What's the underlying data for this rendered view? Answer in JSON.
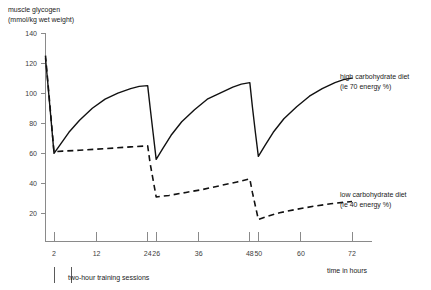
{
  "chart_data": {
    "type": "line",
    "title": "",
    "ylabel_line1": "muscle glycogen",
    "ylabel_line2": "(mmol/kg wet weight)",
    "xlabel": "time in hours",
    "xlim": [
      0,
      72
    ],
    "ylim": [
      0,
      140
    ],
    "grid": false,
    "legend_position": "inline-right",
    "xticks": [
      2,
      12,
      24,
      26,
      36,
      48,
      50,
      60,
      72
    ],
    "xticklabels": [
      "2",
      "12",
      "24",
      "26",
      "36",
      "48",
      "50",
      "60",
      "72"
    ],
    "yticks": [
      20,
      40,
      60,
      80,
      100,
      120,
      140
    ],
    "yticklabels": [
      "20",
      "40",
      "60",
      "80",
      "100",
      "120",
      "140"
    ],
    "annotations": [
      {
        "name": "high-carb-label",
        "line1": "high carbohydrate diet",
        "line2": "(ie 70 energy %)",
        "x": 72,
        "y": 112
      },
      {
        "name": "low-carb-label",
        "line1": "low carbohydrate diet",
        "line2": "(ie 40 energy %)",
        "x": 72,
        "y": 36
      },
      {
        "name": "training-sessions-note",
        "line1": "two-hour training sessions",
        "line2": "",
        "x": 2,
        "y": -22
      }
    ],
    "training_sessions": [
      {
        "label": "session-marker-1",
        "x": 2
      },
      {
        "label": "session-marker-2",
        "x": 6
      }
    ],
    "series": [
      {
        "name": "high carbohydrate diet (ie 70 energy %)",
        "style": "solid",
        "points": [
          [
            0,
            123
          ],
          [
            0.5,
            108
          ],
          [
            1.0,
            92
          ],
          [
            1.5,
            76
          ],
          [
            2.0,
            60
          ],
          [
            3.5,
            66
          ],
          [
            5.5,
            74
          ],
          [
            8,
            82
          ],
          [
            11,
            90
          ],
          [
            14,
            96
          ],
          [
            17,
            100
          ],
          [
            20,
            103
          ],
          [
            22,
            104.5
          ],
          [
            24,
            105
          ],
          [
            24.6,
            90
          ],
          [
            25.3,
            73
          ],
          [
            26,
            56
          ],
          [
            27.5,
            63
          ],
          [
            29.5,
            72
          ],
          [
            32,
            81
          ],
          [
            35,
            89
          ],
          [
            38,
            96
          ],
          [
            41,
            100
          ],
          [
            44,
            104
          ],
          [
            46,
            106
          ],
          [
            48,
            107
          ],
          [
            48.6,
            91
          ],
          [
            49.3,
            74
          ],
          [
            50,
            58
          ],
          [
            51.5,
            65
          ],
          [
            53.5,
            74
          ],
          [
            56,
            83
          ],
          [
            59,
            91
          ],
          [
            62,
            98
          ],
          [
            65,
            103
          ],
          [
            68,
            107
          ],
          [
            70,
            109
          ],
          [
            72,
            110
          ]
        ]
      },
      {
        "name": "low carbohydrate diet (ie 40 energy %)",
        "style": "dashed",
        "points": [
          [
            0,
            125
          ],
          [
            0.5,
            109
          ],
          [
            1.0,
            93
          ],
          [
            1.5,
            77
          ],
          [
            2.0,
            61
          ],
          [
            4,
            61.5
          ],
          [
            8,
            62
          ],
          [
            12,
            62.8
          ],
          [
            16,
            63.5
          ],
          [
            20,
            64.3
          ],
          [
            24,
            65
          ],
          [
            24.6,
            53
          ],
          [
            25.3,
            42
          ],
          [
            26,
            31
          ],
          [
            29,
            32
          ],
          [
            33,
            34
          ],
          [
            37,
            36
          ],
          [
            41,
            38.5
          ],
          [
            45,
            41
          ],
          [
            48,
            43
          ],
          [
            48.6,
            34
          ],
          [
            49.3,
            25
          ],
          [
            50,
            16
          ],
          [
            52,
            18
          ],
          [
            55,
            20.5
          ],
          [
            59,
            22.8
          ],
          [
            63,
            24.8
          ],
          [
            67,
            26.5
          ],
          [
            72,
            28
          ]
        ]
      }
    ]
  }
}
